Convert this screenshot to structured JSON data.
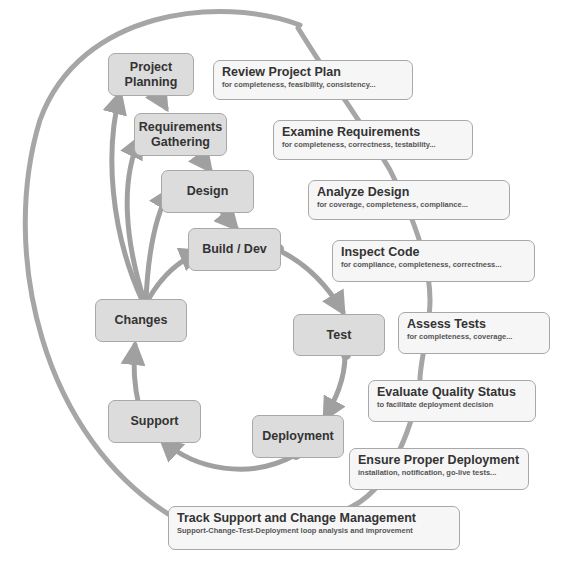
{
  "diagram": {
    "type": "software-qa-lifecycle",
    "colors": {
      "phase_fill": "#dcdcdc",
      "review_fill": "#f6f6f6",
      "border": "#a8a8a8",
      "arrow": "#a0a0a0",
      "text": "#333333"
    },
    "phases": [
      {
        "id": "project-planning",
        "label": "Project\nPlanning"
      },
      {
        "id": "requirements-gathering",
        "label": "Requirements\nGathering"
      },
      {
        "id": "design",
        "label": "Design"
      },
      {
        "id": "build-dev",
        "label": "Build / Dev"
      },
      {
        "id": "test",
        "label": "Test"
      },
      {
        "id": "deployment",
        "label": "Deployment"
      },
      {
        "id": "support",
        "label": "Support"
      },
      {
        "id": "changes",
        "label": "Changes"
      }
    ],
    "reviews": [
      {
        "title": "Review Project Plan",
        "subtitle": "for completeness, feasibility, consistency..."
      },
      {
        "title": "Examine Requirements",
        "subtitle": "for completeness, correctness, testability..."
      },
      {
        "title": "Analyze Design",
        "subtitle": "for coverage, completeness, compliance..."
      },
      {
        "title": "Inspect Code",
        "subtitle": "for compliance, completeness, correctness..."
      },
      {
        "title": "Assess Tests",
        "subtitle": "for completeness, coverage..."
      },
      {
        "title": "Evaluate Quality Status",
        "subtitle": "to facilitate deployment decision"
      },
      {
        "title": "Ensure Proper Deployment",
        "subtitle": "installation, notification, go-live tests..."
      },
      {
        "title": "Track Support and Change Management",
        "subtitle": "Support-Change-Test-Deployment loop analysis and improvement"
      }
    ]
  }
}
